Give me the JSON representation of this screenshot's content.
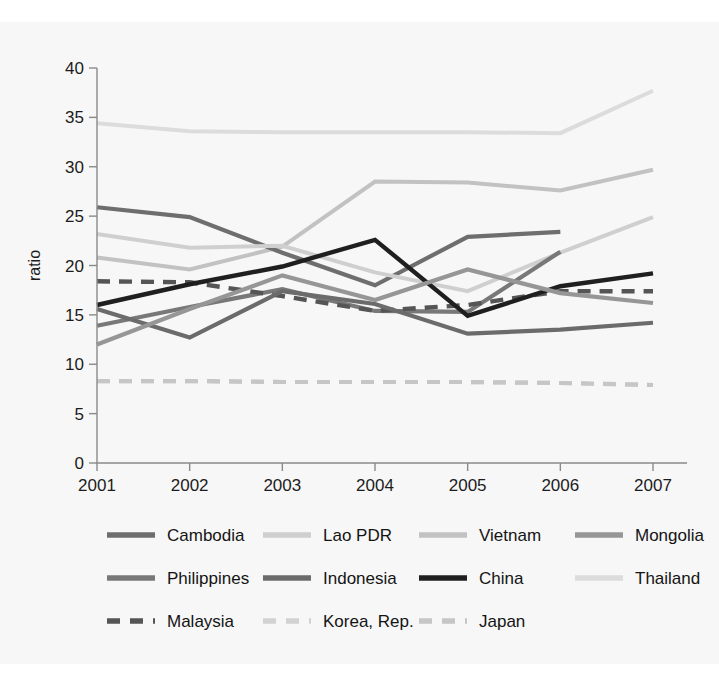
{
  "figure": {
    "background_color": "#f7f7f7",
    "page_background_color": "#ffffff"
  },
  "axes": {
    "y_title": "ratio",
    "y_ticks": [
      "0",
      "5",
      "10",
      "15",
      "20",
      "25",
      "30",
      "35",
      "40"
    ],
    "x_ticks": [
      "2001",
      "2002",
      "2003",
      "2004",
      "2005",
      "2006",
      "2007"
    ]
  },
  "legend": {
    "rows": [
      [
        {
          "label": "Cambodia",
          "color": "#6e6e6e",
          "style": "solid"
        },
        {
          "label": "Lao PDR",
          "color": "#cfcfcf",
          "style": "solid"
        },
        {
          "label": "Vietnam",
          "color": "#c2c2c2",
          "style": "solid"
        },
        {
          "label": "Mongolia",
          "color": "#969696",
          "style": "solid"
        }
      ],
      [
        {
          "label": "Philippines",
          "color": "#787878",
          "style": "solid"
        },
        {
          "label": "Indonesia",
          "color": "#6b6b6b",
          "style": "solid"
        },
        {
          "label": "China",
          "color": "#1f1f1f",
          "style": "solid"
        },
        {
          "label": "Thailand",
          "color": "#dcdcdc",
          "style": "solid"
        }
      ],
      [
        {
          "label": "Malaysia",
          "color": "#555555",
          "style": "dashed"
        },
        {
          "label": "Korea, Rep.",
          "color": "#d2d2d2",
          "style": "dashed"
        },
        {
          "label": "Japan",
          "color": "#c6c6c6",
          "style": "dashed"
        }
      ]
    ]
  },
  "chart_data": {
    "type": "line",
    "title": "",
    "xlabel": "",
    "ylabel": "ratio",
    "x": [
      2001,
      2002,
      2003,
      2004,
      2005,
      2006,
      2007
    ],
    "xlim": [
      2001,
      2007
    ],
    "ylim": [
      0,
      40
    ],
    "y_ticks": [
      0,
      5,
      10,
      15,
      20,
      25,
      30,
      35,
      40
    ],
    "grid": false,
    "legend_position": "bottom",
    "series": [
      {
        "name": "Thailand",
        "color": "#dcdcdc",
        "style": "solid",
        "width": 4.0,
        "values": [
          34.4,
          33.6,
          33.5,
          33.5,
          33.5,
          33.4,
          37.7
        ]
      },
      {
        "name": "Vietnam",
        "color": "#c2c2c2",
        "style": "solid",
        "width": 4.0,
        "values": [
          20.8,
          19.6,
          21.9,
          28.5,
          28.4,
          27.6,
          29.7
        ]
      },
      {
        "name": "Cambodia",
        "color": "#6e6e6e",
        "style": "solid",
        "width": 4.2,
        "values": [
          25.9,
          24.9,
          21.3,
          18.0,
          22.9,
          23.4,
          null
        ]
      },
      {
        "name": "Lao PDR",
        "color": "#cfcfcf",
        "style": "solid",
        "width": 4.0,
        "values": [
          23.2,
          21.8,
          22.0,
          19.3,
          17.4,
          21.3,
          24.9
        ]
      },
      {
        "name": "Philippines",
        "color": "#787878",
        "style": "solid",
        "width": 4.2,
        "values": [
          13.9,
          15.8,
          17.6,
          15.4,
          15.3,
          21.4,
          null
        ]
      },
      {
        "name": "Malaysia",
        "color": "#555555",
        "style": "dashed",
        "width": 4.4,
        "values": [
          18.4,
          18.3,
          16.9,
          15.4,
          16.0,
          17.4,
          17.4
        ]
      },
      {
        "name": "China",
        "color": "#1f1f1f",
        "style": "solid",
        "width": 4.4,
        "values": [
          16.0,
          18.1,
          19.9,
          22.6,
          14.9,
          17.9,
          19.2
        ]
      },
      {
        "name": "Indonesia",
        "color": "#6b6b6b",
        "style": "solid",
        "width": 4.2,
        "values": [
          15.6,
          12.7,
          17.4,
          16.1,
          13.1,
          13.5,
          14.2
        ]
      },
      {
        "name": "Mongolia",
        "color": "#969696",
        "style": "solid",
        "width": 4.2,
        "values": [
          12.0,
          15.6,
          19.0,
          16.5,
          19.6,
          17.2,
          16.2
        ]
      },
      {
        "name": "Korea, Rep.",
        "color": "#d2d2d2",
        "style": "dashed",
        "width": 4.2,
        "values": [
          8.3,
          8.3,
          8.2,
          8.2,
          8.2,
          8.1,
          7.9
        ]
      },
      {
        "name": "Japan",
        "color": "#c6c6c6",
        "style": "dashed",
        "width": 4.2,
        "values": [
          8.3,
          8.3,
          8.2,
          8.2,
          8.2,
          8.1,
          7.9
        ]
      }
    ]
  }
}
